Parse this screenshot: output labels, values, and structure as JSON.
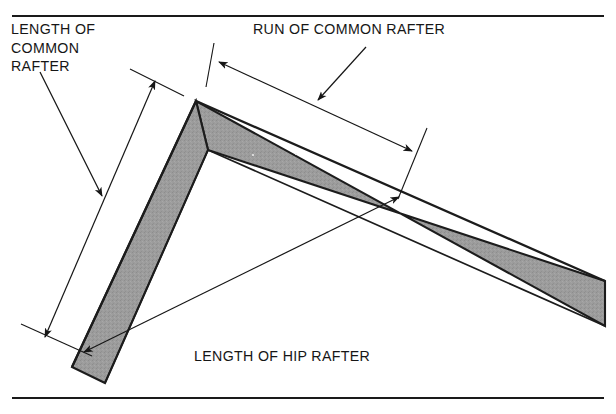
{
  "figure": {
    "kind": "technical-illustration",
    "background_color": "#ffffff",
    "ink_color": "#161616",
    "square_fill_color": "#9a9a9a",
    "square_edge_color": "#1c1c1c",
    "top_rule": "horizontal-rule",
    "bottom_rule": "horizontal-rule"
  },
  "labels": {
    "length_of_common_rafter": {
      "line1": "LENGTH OF",
      "line2": "COMMON",
      "line3": "RAFTER"
    },
    "run_of_common_rafter": "RUN OF COMMON RAFTER",
    "length_of_hip_rafter": "LENGTH OF HIP RAFTER"
  },
  "annotations": {
    "dimension_common_rafter": {
      "name": "LENGTH OF COMMON RAFTER",
      "style": "double-headed-dimension-arrow"
    },
    "dimension_run_common_rafter": {
      "name": "RUN OF COMMON RAFTER",
      "style": "double-headed-dimension-arrow"
    },
    "dimension_hip_rafter": {
      "name": "LENGTH OF HIP RAFTER",
      "style": "double-headed-dimension-arrow"
    },
    "leader_common_rafter": {
      "style": "single-headed-leader-arrow"
    },
    "leader_run_rafter": {
      "style": "single-headed-leader-arrow"
    }
  }
}
